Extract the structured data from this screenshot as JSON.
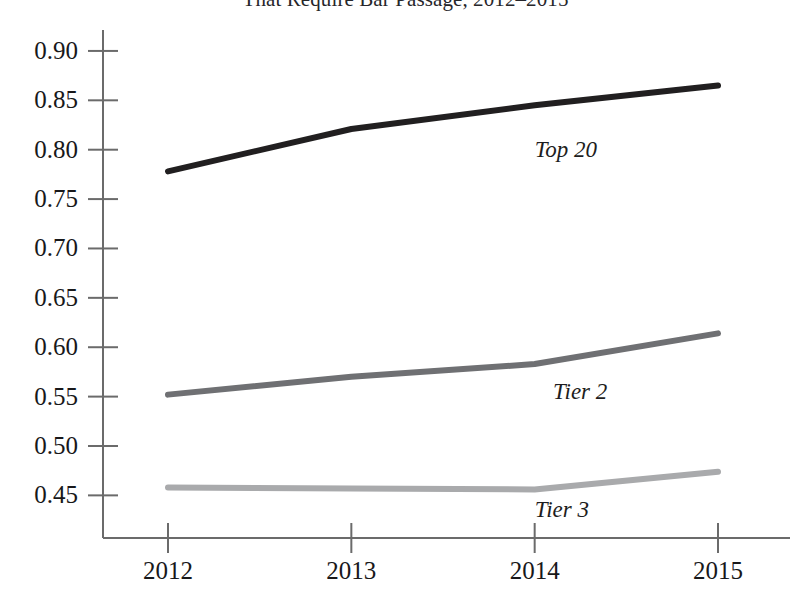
{
  "chart_data": {
    "type": "line",
    "title": "That Require Bar Passage, 2012–2015",
    "title_line_1": "",
    "title_line_2": "That Require Bar Passage, 2012–2015",
    "title_truncated": true,
    "xlabel": "",
    "ylabel": "",
    "x": [
      2012,
      2013,
      2014,
      2015
    ],
    "categories": [
      "2012",
      "2013",
      "2014",
      "2015"
    ],
    "xlim": [
      2012,
      2015
    ],
    "ylim": [
      0.42,
      0.905
    ],
    "yticks": [
      0.45,
      0.5,
      0.55,
      0.6,
      0.65,
      0.7,
      0.75,
      0.8,
      0.85,
      0.9
    ],
    "ytick_labels": [
      "0.45",
      "0.50",
      "0.55",
      "0.60",
      "0.65",
      "0.70",
      "0.75",
      "0.80",
      "0.85",
      "0.90"
    ],
    "xticks": [
      2012,
      2013,
      2014,
      2015
    ],
    "xtick_labels": [
      "2012",
      "2013",
      "2014",
      "2015"
    ],
    "grid": false,
    "legend_position": "inline-annotations",
    "series": [
      {
        "name": "Top 20",
        "label": "Top 20",
        "color": "#211f20",
        "line_width": 6,
        "values": [
          0.778,
          0.821,
          0.845,
          0.865
        ]
      },
      {
        "name": "Tier 2",
        "label": "Tier 2",
        "color": "#6f7073",
        "line_width": 6,
        "values": [
          0.552,
          0.57,
          0.583,
          0.614
        ]
      },
      {
        "name": "Tier 3",
        "label": "Tier 3",
        "color": "#a9aaac",
        "line_width": 6,
        "values": [
          0.458,
          0.457,
          0.456,
          0.474
        ]
      }
    ],
    "annotations": [
      {
        "text": "Top 20",
        "series": "Top 20",
        "x": 2014.0,
        "y": 0.8
      },
      {
        "text": "Tier 2",
        "series": "Tier 2",
        "x": 2014.1,
        "y": 0.555
      },
      {
        "text": "Tier 3",
        "series": "Tier 3",
        "x": 2014.0,
        "y": 0.435
      }
    ],
    "axis_color": "#6b6b6b"
  }
}
